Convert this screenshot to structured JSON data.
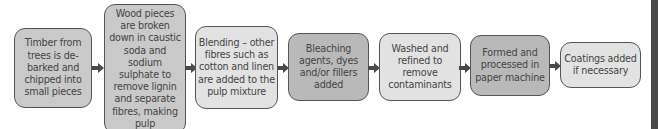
{
  "diagram": {
    "type": "flowchart",
    "direction": "left-to-right",
    "steps": [
      {
        "id": 1,
        "text": "Timber from trees is de-barked and chipped into small pieces"
      },
      {
        "id": 2,
        "text": "Wood pieces are broken down in caustic soda and sodium sulphate to remove lignin and separate fibres, making pulp"
      },
      {
        "id": 3,
        "text": "Blending – other fibres such as cotton and linen are added to the pulp mixture"
      },
      {
        "id": 4,
        "text": "Bleaching agents, dyes and/or fillers added"
      },
      {
        "id": 5,
        "text": "Washed and refined to remove contaminants"
      },
      {
        "id": 6,
        "text": "Formed and processed in paper machine"
      },
      {
        "id": 7,
        "text": "Coatings added if necessary"
      }
    ],
    "connector": "arrow-right",
    "colors": {
      "border": "#555555",
      "mid": "#c9c9c9",
      "light": "#e2e2e2",
      "dark": "#b9b9b9",
      "arrow": "#4a4a4a",
      "sidebar": "#4a4a4a"
    }
  }
}
